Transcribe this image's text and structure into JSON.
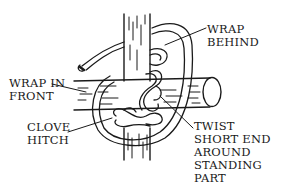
{
  "diagram": {
    "colors": {
      "ink": "#1a1a1a",
      "background": "#ffffff"
    },
    "labels": {
      "wrap_behind": [
        "WRAP",
        "BEHIND"
      ],
      "wrap_in_front": [
        "WRAP IN",
        "FRONT"
      ],
      "clove_hitch": [
        "CLOVE",
        "HITCH"
      ],
      "twist": [
        "TWIST",
        "SHORT END",
        "AROUND",
        "STANDING",
        "PART"
      ]
    }
  }
}
